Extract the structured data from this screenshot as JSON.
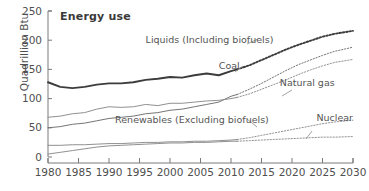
{
  "chart_data": {
    "type": "line",
    "title": "Energy use",
    "xlabel": "",
    "ylabel": "Quadrillion Btu",
    "xlim": [
      1980,
      2030
    ],
    "ylim": [
      0,
      250
    ],
    "xticks": [
      "1980",
      "1985",
      "1990",
      "1995",
      "2000",
      "2005",
      "2010",
      "2015",
      "2020",
      "2025",
      "2030"
    ],
    "yticks": [
      "0",
      "50",
      "100",
      "150",
      "200",
      "250"
    ],
    "grid": false,
    "legend_position": "inline-annotations",
    "history_projection_split": 2011,
    "annotations": [
      {
        "text": "Liquids (Including biofuels)",
        "x": 1996,
        "y": 196
      },
      {
        "text": "Coal",
        "x": 2008,
        "y": 150
      },
      {
        "text": "Natural gas",
        "x": 2018,
        "y": 122
      },
      {
        "text": "Renewables (Excluding biofuels)",
        "x": 1991,
        "y": 58
      },
      {
        "text": "Nuclear",
        "x": 2024,
        "y": 62
      }
    ],
    "x": [
      1980,
      1982,
      1984,
      1986,
      1988,
      1990,
      1992,
      1994,
      1996,
      1998,
      2000,
      2002,
      2004,
      2006,
      2008,
      2010,
      2011,
      2013,
      2015,
      2017,
      2019,
      2021,
      2023,
      2025,
      2027,
      2030
    ],
    "series": [
      {
        "name": "Liquids (Including biofuels)",
        "style": "solid-then-dotted",
        "width": "thick",
        "color": "#3c3c3c",
        "values": [
          128,
          120,
          118,
          120,
          124,
          126,
          126,
          128,
          132,
          134,
          137,
          136,
          140,
          143,
          140,
          147,
          150,
          157,
          166,
          175,
          184,
          192,
          199,
          206,
          211,
          216
        ]
      },
      {
        "name": "Coal",
        "style": "solid-then-dotted",
        "width": "thin",
        "color": "#6e6e6e",
        "values": [
          50,
          52,
          56,
          58,
          62,
          66,
          68,
          70,
          74,
          76,
          80,
          82,
          86,
          90,
          94,
          104,
          107,
          116,
          126,
          137,
          148,
          158,
          166,
          174,
          181,
          188
        ]
      },
      {
        "name": "Natural gas",
        "style": "solid-then-dotted",
        "width": "thin",
        "color": "#8a8a8a",
        "values": [
          68,
          70,
          74,
          76,
          82,
          86,
          85,
          86,
          90,
          88,
          92,
          92,
          94,
          96,
          97,
          100,
          102,
          108,
          116,
          124,
          132,
          141,
          149,
          156,
          162,
          167
        ]
      },
      {
        "name": "Renewables (Excluding biofuels)",
        "style": "solid-then-dotted",
        "width": "thin",
        "color": "#8a8a8a",
        "values": [
          20,
          20,
          21,
          21,
          22,
          23,
          23,
          24,
          25,
          25,
          26,
          26,
          27,
          27,
          28,
          29,
          30,
          33,
          37,
          41,
          45,
          49,
          53,
          57,
          60,
          63
        ]
      },
      {
        "name": "Nuclear",
        "style": "solid-then-dotted",
        "width": "thin",
        "color": "#8a8a8a",
        "values": [
          5,
          8,
          11,
          14,
          17,
          19,
          20,
          21,
          22,
          23,
          24,
          24,
          25,
          25,
          26,
          27,
          27,
          28,
          29,
          30,
          31,
          32,
          33,
          34,
          34,
          35
        ]
      }
    ]
  }
}
